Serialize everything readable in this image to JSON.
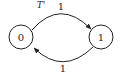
{
  "diagram": {
    "type": "state-transition",
    "title_label": "T'",
    "states": [
      {
        "id": "s0",
        "label": "0"
      },
      {
        "id": "s1",
        "label": "1"
      }
    ],
    "transitions": [
      {
        "from": "0",
        "to": "1",
        "label": "1"
      },
      {
        "from": "1",
        "to": "0",
        "label": "1"
      }
    ],
    "colors": {
      "stroke": "#222222",
      "background": "#ffffff"
    }
  }
}
